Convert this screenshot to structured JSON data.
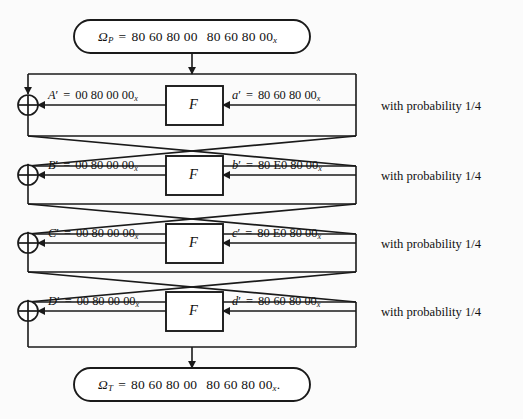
{
  "figure": {
    "type": "feistel-differential-characteristic",
    "rounds": 4
  },
  "input_box": {
    "symbol": "Ω",
    "subscript": "P",
    "equals": "=",
    "value_left": "80 60 80 00",
    "value_right": "80 60 80 00",
    "hex_subscript": "x",
    "trailing": "",
    "full_text": "ΩP = 80 60 80 00  80 60 80 00x"
  },
  "output_box": {
    "symbol": "Ω",
    "subscript": "T",
    "equals": "=",
    "value_left": "80 60 80 00",
    "value_right": "80 60 80 00",
    "hex_subscript": "x",
    "trailing": ".",
    "full_text": "ΩT = 80 60 80 00  80 60 80 00x."
  },
  "f_label": "F",
  "xor_symbol": "⊕",
  "rounds": [
    {
      "index": 1,
      "left_name": "A",
      "left_prime": "′",
      "left_equals": "=",
      "left_value": "00 80 00 00",
      "left_hex_sub": "x",
      "right_name": "a",
      "right_prime": "′",
      "right_equals": "=",
      "right_value": "80 60 80 00",
      "right_hex_sub": "x",
      "probability": "with probability 1/4"
    },
    {
      "index": 2,
      "left_name": "B",
      "left_prime": "′",
      "left_equals": "=",
      "left_value": "00 80 00 00",
      "left_hex_sub": "x",
      "right_name": "b",
      "right_prime": "′",
      "right_equals": "=",
      "right_value": "80 E0 80 00",
      "right_hex_sub": "x",
      "probability": "with probability 1/4"
    },
    {
      "index": 3,
      "left_name": "C",
      "left_prime": "′",
      "left_equals": "=",
      "left_value": "00 80 00 00",
      "left_hex_sub": "x",
      "right_name": "c",
      "right_prime": "′",
      "right_equals": "=",
      "right_value": "80 E0 80 00",
      "right_hex_sub": "x",
      "probability": "with probability 1/4"
    },
    {
      "index": 4,
      "left_name": "D",
      "left_prime": "′",
      "left_equals": "=",
      "left_value": "00 80 00 00",
      "left_hex_sub": "x",
      "right_name": "d",
      "right_prime": "′",
      "right_equals": "=",
      "right_value": "80 60 80 00",
      "right_hex_sub": "x",
      "probability": "with probability 1/4"
    }
  ],
  "colors": {
    "ink": "#1a1a1a",
    "background": "#fbfbfb",
    "box_fill": "#ffffff"
  }
}
